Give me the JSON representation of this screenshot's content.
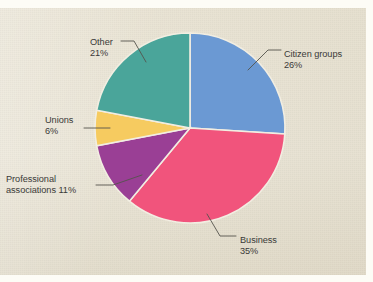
{
  "chart_data": {
    "type": "pie",
    "title": "",
    "subtitle": "",
    "xlabel": "",
    "ylabel": "",
    "legend_position": "none",
    "grid": false,
    "units": "percent",
    "start_angle_deg": 0,
    "direction": "clockwise",
    "categories": [
      "Citizen groups",
      "Business",
      "Professional associations",
      "Unions",
      "Other"
    ],
    "values": [
      26,
      35,
      11,
      6,
      21
    ],
    "slices": [
      {
        "label": "Citizen groups",
        "value": 26,
        "value_text": "26%",
        "color": "#6b99d3",
        "start_deg": 0,
        "end_deg": 93.6,
        "label_lines": [
          "Citizen groups",
          "26%"
        ]
      },
      {
        "label": "Business",
        "value": 35,
        "value_text": "35%",
        "color": "#f1547c",
        "start_deg": 93.6,
        "end_deg": 219.6,
        "label_lines": [
          "Business",
          "35%"
        ]
      },
      {
        "label": "Professional associations",
        "value": 11,
        "value_text": "11%",
        "color": "#9a3f95",
        "start_deg": 219.6,
        "end_deg": 259.2,
        "label_lines": [
          "Professional",
          "associations 11%"
        ]
      },
      {
        "label": "Unions",
        "value": 6,
        "value_text": "6%",
        "color": "#f6cb60",
        "start_deg": 259.2,
        "end_deg": 280.8,
        "label_lines": [
          "Unions",
          "6%"
        ]
      },
      {
        "label": "Other",
        "value": 21,
        "value_text": "21%",
        "color": "#4aa59a",
        "start_deg": 280.8,
        "end_deg": 360,
        "label_lines": [
          "Other",
          "21%"
        ]
      }
    ]
  },
  "labels": {
    "citizen": {
      "name": "Citizen groups",
      "pct": "26%"
    },
    "business": {
      "name": "Business",
      "pct": "35%"
    },
    "professional": {
      "line1": "Professional",
      "line2": "associations 11%"
    },
    "unions": {
      "name": "Unions",
      "pct": "6%"
    },
    "other": {
      "name": "Other",
      "pct": "21%"
    }
  },
  "colors": {
    "citizen": "#6b99d3",
    "business": "#f1547c",
    "professional": "#9a3f95",
    "unions": "#f6cb60",
    "other": "#4aa59a",
    "paper": "#e7e1cf",
    "text": "#3a3a38",
    "leader": "#55534d",
    "slice_gap": "#f2eee2"
  }
}
